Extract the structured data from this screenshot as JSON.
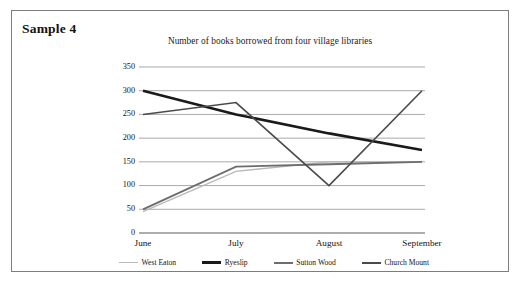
{
  "card": {
    "sample_label": "Sample 4"
  },
  "chart_data": {
    "type": "line",
    "title": "Number of books borrowed from four village libraries",
    "xlabel": "",
    "ylabel": "",
    "categories": [
      "June",
      "July",
      "August",
      "September"
    ],
    "ylim": [
      0,
      350
    ],
    "yticks": [
      0,
      50,
      100,
      150,
      200,
      250,
      300,
      350
    ],
    "ytick_labels": [
      "0",
      "50",
      "100",
      "150",
      "200",
      "250",
      "300",
      "350"
    ],
    "grid": "horizontal",
    "legend_position": "bottom",
    "series": [
      {
        "name": "West Eaton",
        "values": [
          45,
          130,
          150,
          150
        ],
        "color": "#b9b9b9",
        "width": 1.4
      },
      {
        "name": "Ryeslip",
        "values": [
          300,
          250,
          210,
          175
        ],
        "color": "#1a1a1a",
        "width": 2.6
      },
      {
        "name": "Sutton Wood",
        "values": [
          50,
          140,
          145,
          150
        ],
        "color": "#6d6d6d",
        "width": 1.9
      },
      {
        "name": "Church Mount",
        "values": [
          250,
          275,
          100,
          300
        ],
        "color": "#4a4a4a",
        "width": 1.6
      }
    ]
  }
}
